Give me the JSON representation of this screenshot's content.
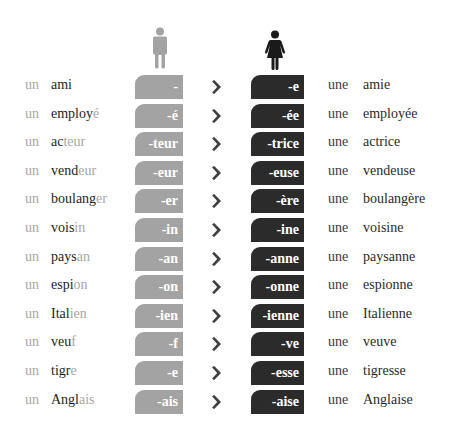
{
  "header": {
    "masculine_icon": "man-icon",
    "feminine_icon": "woman-icon",
    "colors": {
      "masculine": "#a3a3a3",
      "feminine": "#2b2b2b",
      "arrow": "#3f3f3f",
      "masc_ending_text": "#a6a6a6"
    }
  },
  "rows": [
    {
      "art_m": "un",
      "stem_m": "ami",
      "end_m": "",
      "suffix_m": "-",
      "suffix_f": "-e",
      "art_f": "une",
      "word_f": "amie"
    },
    {
      "art_m": "un",
      "stem_m": "employ",
      "end_m": "é",
      "suffix_m": "-é",
      "suffix_f": "-ée",
      "art_f": "une",
      "word_f": "employée"
    },
    {
      "art_m": "un",
      "stem_m": "ac",
      "end_m": "teur",
      "suffix_m": "-teur",
      "suffix_f": "-trice",
      "art_f": "une",
      "word_f": "actrice"
    },
    {
      "art_m": "un",
      "stem_m": "vend",
      "end_m": "eur",
      "suffix_m": "-eur",
      "suffix_f": "-euse",
      "art_f": "une",
      "word_f": "vendeuse"
    },
    {
      "art_m": "un",
      "stem_m": "boulang",
      "end_m": "er",
      "suffix_m": "-er",
      "suffix_f": "-ère",
      "art_f": "une",
      "word_f": "boulangère"
    },
    {
      "art_m": "un",
      "stem_m": "vois",
      "end_m": "in",
      "suffix_m": "-in",
      "suffix_f": "-ine",
      "art_f": "une",
      "word_f": "voisine"
    },
    {
      "art_m": "un",
      "stem_m": "pays",
      "end_m": "an",
      "suffix_m": "-an",
      "suffix_f": "-anne",
      "art_f": "une",
      "word_f": "paysanne"
    },
    {
      "art_m": "un",
      "stem_m": "espi",
      "end_m": "on",
      "suffix_m": "-on",
      "suffix_f": "-onne",
      "art_f": "une",
      "word_f": "espionne"
    },
    {
      "art_m": "un",
      "stem_m": "Ital",
      "end_m": "ien",
      "suffix_m": "-ien",
      "suffix_f": "-ienne",
      "art_f": "une",
      "word_f": "Italienne"
    },
    {
      "art_m": "un",
      "stem_m": "veu",
      "end_m": "f",
      "suffix_m": "-f",
      "suffix_f": "-ve",
      "art_f": "une",
      "word_f": "veuve"
    },
    {
      "art_m": "un",
      "stem_m": "tigr",
      "end_m": "e",
      "suffix_m": "-e",
      "suffix_f": "-esse",
      "art_f": "une",
      "word_f": "tigresse"
    },
    {
      "art_m": "un",
      "stem_m": "Angl",
      "end_m": "ais",
      "suffix_m": "-ais",
      "suffix_f": "-aise",
      "art_f": "une",
      "word_f": "Anglaise"
    }
  ]
}
